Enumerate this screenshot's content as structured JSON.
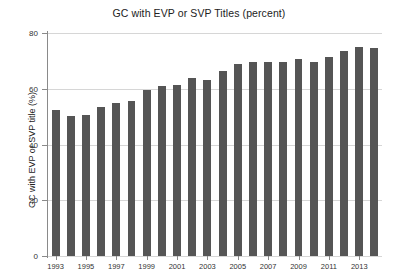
{
  "chart_data": {
    "type": "bar",
    "title": "GC with EVP or SVP Titles (percent)",
    "xlabel": "",
    "ylabel": "GC with EVP or SVP title (%)",
    "ylim": [
      0,
      80
    ],
    "yticks": [
      0,
      20,
      40,
      60,
      80
    ],
    "ytick_labels": [
      "0",
      "20",
      "40",
      "60",
      "80"
    ],
    "grid": true,
    "legend": null,
    "bar_color": "#555555",
    "categories": [
      "1993",
      "1994",
      "1995",
      "1996",
      "1997",
      "1998",
      "1999",
      "2000",
      "2001",
      "2002",
      "2003",
      "2004",
      "2005",
      "2006",
      "2007",
      "2008",
      "2009",
      "2010",
      "2011",
      "2012",
      "2013",
      "2014"
    ],
    "xtick_labels": [
      "1993",
      "1995",
      "1997",
      "1999",
      "2001",
      "2003",
      "2005",
      "2007",
      "2009",
      "2011",
      "2013"
    ],
    "values": [
      52.5,
      50.2,
      50.5,
      53.5,
      55.0,
      55.5,
      59.5,
      61.0,
      61.5,
      64.0,
      63.0,
      66.5,
      69.0,
      69.5,
      69.5,
      69.5,
      70.5,
      69.5,
      71.5,
      73.5,
      75.0,
      74.5
    ]
  }
}
